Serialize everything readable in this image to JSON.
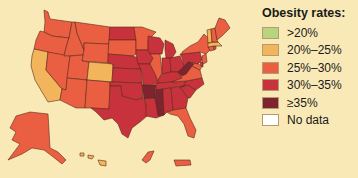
{
  "legend": {
    "title": "Obesity rates:",
    "items": [
      {
        "key": "lt20",
        "label": ">20%",
        "color": "#b6d57c"
      },
      {
        "key": "20_25",
        "label": "20%–25%",
        "color": "#f3b55c"
      },
      {
        "key": "25_30",
        "label": "25%–30%",
        "color": "#ea5f42"
      },
      {
        "key": "30_35",
        "label": "30%–35%",
        "color": "#c8323c"
      },
      {
        "key": "ge35",
        "label": "≥35%",
        "color": "#7e2430"
      },
      {
        "key": "nodata",
        "label": "No data",
        "color": "#ffffff"
      }
    ]
  },
  "map": {
    "region": "United States",
    "states": {
      "WA": "25_30",
      "OR": "25_30",
      "CA": "20_25",
      "NV": "25_30",
      "ID": "25_30",
      "MT": "25_30",
      "WY": "25_30",
      "UT": "25_30",
      "AZ": "25_30",
      "CO": "20_25",
      "NM": "25_30",
      "ND": "30_35",
      "SD": "25_30",
      "NE": "30_35",
      "KS": "30_35",
      "OK": "30_35",
      "TX": "30_35",
      "MN": "25_30",
      "IA": "30_35",
      "MO": "30_35",
      "AR": "ge35",
      "LA": "30_35",
      "WI": "30_35",
      "IL": "25_30",
      "MI": "30_35",
      "IN": "30_35",
      "OH": "30_35",
      "KY": "30_35",
      "TN": "30_35",
      "MS": "ge35",
      "AL": "30_35",
      "GA": "30_35",
      "FL": "25_30",
      "SC": "30_35",
      "NC": "30_35",
      "VA": "25_30",
      "WV": "ge35",
      "PA": "30_35",
      "NY": "25_30",
      "VT": "20_25",
      "NH": "25_30",
      "ME": "25_30",
      "MA": "20_25",
      "CT": "25_30",
      "RI": "25_30",
      "NJ": "25_30",
      "DE": "30_35",
      "MD": "25_30",
      "AK": "25_30",
      "HI": "20_25",
      "PR": "25_30"
    }
  }
}
